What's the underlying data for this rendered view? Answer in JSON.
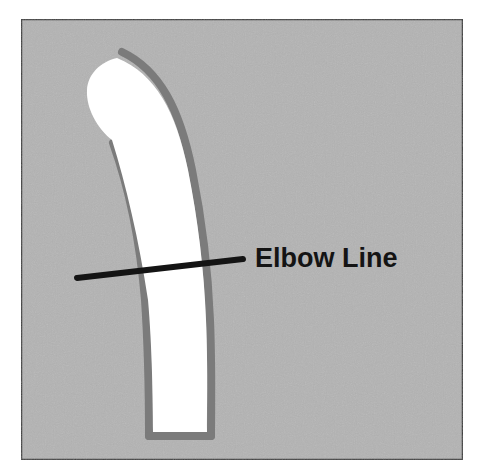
{
  "diagram": {
    "label": "Elbow Line",
    "colors": {
      "background": "#b3b3b3",
      "frame": "#3a3a3a",
      "outline": "#7b7b7b",
      "fill": "#ffffff",
      "marker_line": "#141414",
      "label": "#141414"
    }
  }
}
